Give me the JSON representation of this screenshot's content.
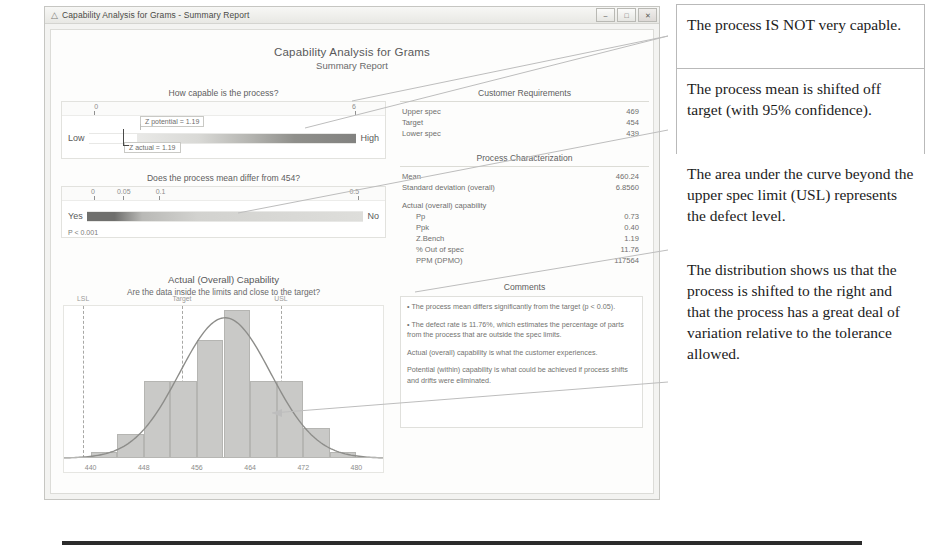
{
  "window": {
    "title": "Capability Analysis for Grams - Summary Report",
    "icon": "minitab-graph-icon",
    "buttons": {
      "minimize": "–",
      "maximize": "□",
      "close": "✕"
    }
  },
  "report": {
    "title": "Capability Analysis for Grams",
    "subtitle": "Summary Report"
  },
  "capability_gauge": {
    "question": "How capable is the process?",
    "scale_min": "0",
    "scale_max": "6",
    "left_label": "Low",
    "right_label": "High",
    "marker_potential": "Z potential = 1.19",
    "marker_actual": "Z actual = 1.19"
  },
  "pvalue_gauge": {
    "question": "Does the process mean differ from 454?",
    "ticks": [
      "0",
      "0.05",
      "0.1",
      "0.5"
    ],
    "left_label": "Yes",
    "right_label": "No",
    "p_note": "P < 0.001"
  },
  "histogram": {
    "title": "Actual (Overall) Capability",
    "subtitle": "Are the data inside the limits and close to the target?",
    "spec_labels": {
      "lsl": "LSL",
      "target": "Target",
      "usl": "USL"
    }
  },
  "customer_requirements": {
    "heading": "Customer Requirements",
    "rows": [
      {
        "label": "Upper spec",
        "value": "469"
      },
      {
        "label": "Target",
        "value": "454"
      },
      {
        "label": "Lower spec",
        "value": "439"
      }
    ]
  },
  "process_characterization": {
    "heading": "Process Characterization",
    "rows": [
      {
        "label": "Mean",
        "value": "460.24"
      },
      {
        "label": "Standard deviation (overall)",
        "value": "6.8560"
      }
    ],
    "capability_heading": "Actual (overall) capability",
    "capability_rows": [
      {
        "label": "Pp",
        "value": "0.73"
      },
      {
        "label": "Ppk",
        "value": "0.40"
      },
      {
        "label": "Z.Bench",
        "value": "1.19"
      },
      {
        "label": "% Out of spec",
        "value": "11.76"
      },
      {
        "label": "PPM (DPMO)",
        "value": "117564"
      }
    ]
  },
  "comments": {
    "heading": "Comments",
    "items": [
      "• The process mean differs significantly from the target (p < 0.05).",
      "• The defect rate is 11.76%, which estimates the percentage of parts from the process that are outside the spec limits.",
      "Actual (overall) capability is what the customer experiences.",
      "Potential (within) capability is what could be achieved if process shifts and drifts were eliminated."
    ]
  },
  "notes": [
    "The process IS NOT very capable.",
    "The process mean is shifted off target (with 95% confidence).",
    "The area under the curve beyond the upper spec limit (USL) represents the defect level.",
    "The distribution shows us that the process is shifted to the right and that the process has a great deal of variation relative to the tolerance allowed."
  ],
  "chart_data": {
    "type": "bar",
    "title": "Actual (Overall) Capability",
    "subtitle": "Are the data inside the limits and close to the target?",
    "xlabel": "",
    "ylabel": "Frequency",
    "xlim": [
      436,
      484
    ],
    "x_ticks": [
      "440",
      "448",
      "456",
      "464",
      "472",
      "480"
    ],
    "x_tick_values": [
      440,
      448,
      456,
      464,
      472,
      480
    ],
    "bin_edges": [
      440,
      444,
      448,
      452,
      456,
      460,
      464,
      468,
      472,
      476,
      480
    ],
    "bin_centers": [
      442,
      446,
      450,
      454,
      458,
      462,
      466,
      470,
      474,
      478
    ],
    "values": [
      1,
      4,
      13,
      13,
      20,
      25,
      13,
      13,
      5,
      1
    ],
    "grid": false,
    "legend": null,
    "reference_lines": [
      {
        "name": "LSL",
        "value": 439,
        "style": "dashed"
      },
      {
        "name": "Target",
        "value": 454,
        "style": "dashed"
      },
      {
        "name": "USL",
        "value": 469,
        "style": "dashed"
      }
    ],
    "overlay_curve": {
      "type": "normal",
      "mean": 460.24,
      "sd": 6.856
    }
  },
  "colors": {
    "bar_fill": "#c9c9c7",
    "bar_edge": "#b5b5b2",
    "curve": "#8d8d8a",
    "spec_line": "#a8a8a5",
    "gauge_dark": "#6f6f6d",
    "gauge_light": "#e9e9e7",
    "note_border": "#b9b9b9",
    "text": "#6e6e6c"
  }
}
